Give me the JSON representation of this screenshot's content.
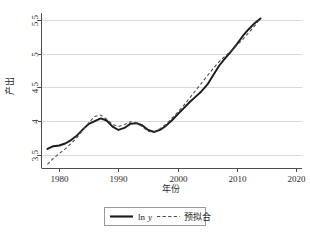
{
  "chart_data": {
    "type": "line",
    "title": "",
    "xlabel": "年份",
    "ylabel": "产出",
    "xlim": [
      1977,
      2021
    ],
    "ylim": [
      3.3,
      5.6
    ],
    "xticks": [
      1980,
      1990,
      2000,
      2010,
      2020
    ],
    "xtick_labels": [
      "1980",
      "1990",
      "2000",
      "2010",
      "2020"
    ],
    "yticks": [
      3.5,
      4,
      4.5,
      5,
      5.5
    ],
    "ytick_labels": [
      "3.5",
      "4",
      "4.5",
      "5",
      "5.5"
    ],
    "grid": "horizontal",
    "legend_position": "below",
    "x": [
      1978,
      1979,
      1980,
      1981,
      1982,
      1983,
      1984,
      1985,
      1986,
      1987,
      1988,
      1989,
      1990,
      1991,
      1992,
      1993,
      1994,
      1995,
      1996,
      1997,
      1998,
      1999,
      2000,
      2001,
      2002,
      2003,
      2004,
      2005,
      2006,
      2007,
      2008,
      2009,
      2010,
      2011,
      2012,
      2013,
      2014
    ],
    "series": [
      {
        "name": "ln y",
        "style": "solid",
        "color": "#1a1a1a",
        "values": [
          3.59,
          3.63,
          3.64,
          3.67,
          3.72,
          3.79,
          3.88,
          3.96,
          4.0,
          4.04,
          4.01,
          3.92,
          3.87,
          3.9,
          3.96,
          3.97,
          3.94,
          3.87,
          3.84,
          3.87,
          3.93,
          4.01,
          4.1,
          4.19,
          4.28,
          4.36,
          4.44,
          4.54,
          4.68,
          4.82,
          4.93,
          5.03,
          5.14,
          5.26,
          5.36,
          5.45,
          5.52
        ]
      },
      {
        "name": "预拟合",
        "style": "dashed",
        "color": "#4a4a4a",
        "values": [
          3.36,
          3.45,
          3.52,
          3.59,
          3.67,
          3.76,
          3.87,
          3.98,
          4.07,
          4.09,
          4.03,
          3.95,
          3.92,
          3.95,
          3.99,
          3.98,
          3.92,
          3.85,
          3.84,
          3.89,
          3.95,
          4.04,
          4.13,
          4.23,
          4.34,
          4.45,
          4.56,
          4.67,
          4.78,
          4.88,
          4.96,
          5.04,
          5.12,
          5.21,
          5.31,
          5.41,
          5.52
        ]
      }
    ],
    "legend": [
      {
        "label": "ln y",
        "label_plain": "ln",
        "label_italic": "y",
        "style": "solid"
      },
      {
        "label": "预拟合",
        "style": "dashed"
      }
    ]
  },
  "colors": {
    "grid": "#d9d9d9",
    "axis": "#4d4d4d",
    "solid_series": "#1a1a1a",
    "dashed_series": "#4a4a4a",
    "legend_border": "#9a9a9a",
    "background": "#ffffff"
  }
}
